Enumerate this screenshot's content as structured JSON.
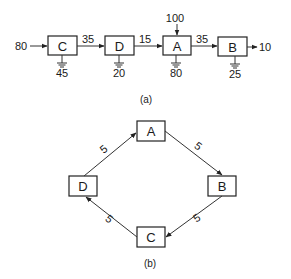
{
  "diagram_a": {
    "caption": "(a)",
    "nodes": [
      {
        "id": "C",
        "label": "C",
        "ground": "45"
      },
      {
        "id": "D",
        "label": "D",
        "ground": "20"
      },
      {
        "id": "A",
        "label": "A",
        "ground": "80",
        "top_input": "100"
      },
      {
        "id": "B",
        "label": "B",
        "ground": "25"
      }
    ],
    "input_left": "80",
    "edges": [
      {
        "from": "C",
        "to": "D",
        "label": "35"
      },
      {
        "from": "D",
        "to": "A",
        "label": "15"
      },
      {
        "from": "A",
        "to": "B",
        "label": "35"
      }
    ],
    "output_right": "10"
  },
  "diagram_b": {
    "caption": "(b)",
    "nodes": [
      {
        "id": "A",
        "label": "A"
      },
      {
        "id": "B",
        "label": "B"
      },
      {
        "id": "C",
        "label": "C"
      },
      {
        "id": "D",
        "label": "D"
      }
    ],
    "edges": [
      {
        "from": "A",
        "to": "B",
        "label": "5"
      },
      {
        "from": "B",
        "to": "C",
        "label": "5"
      },
      {
        "from": "C",
        "to": "D",
        "label": "5"
      },
      {
        "from": "D",
        "to": "A",
        "label": "5"
      }
    ]
  }
}
